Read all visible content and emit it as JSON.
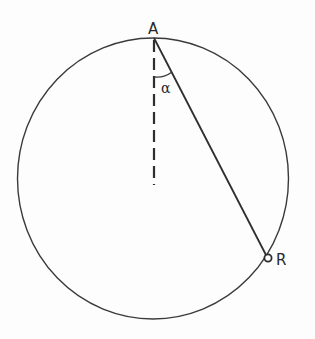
{
  "figure": {
    "colors": {
      "background": "#fdfdfd",
      "stroke": "#3a3a3a",
      "text": "#2a2a2a"
    },
    "circle": {
      "cx": 153,
      "cy": 178,
      "rx": 135,
      "ry": 140
    },
    "points": {
      "A": {
        "label": "A",
        "x": 154,
        "y": 38
      },
      "R": {
        "label": "R",
        "x": 268,
        "y": 258
      }
    },
    "dashed_line": {
      "x": 154,
      "y1": 38,
      "y2": 184
    },
    "angle": {
      "label": "α",
      "vertex": "A",
      "between": [
        "dashed_line",
        "chord_AR"
      ]
    }
  }
}
